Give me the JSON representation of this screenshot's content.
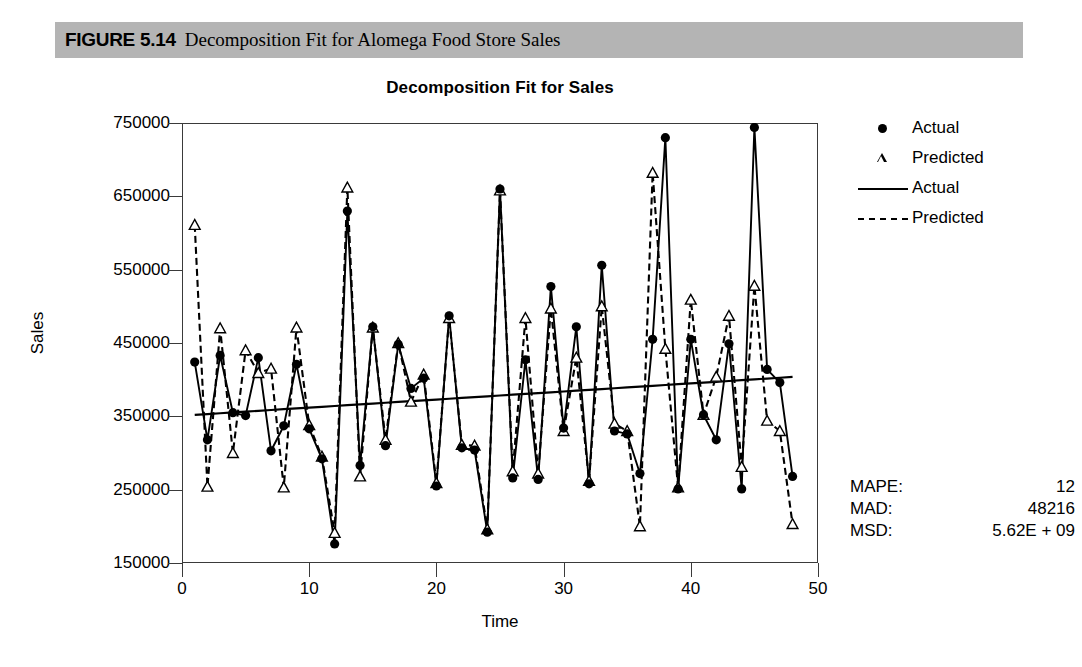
{
  "figure": {
    "number": "FIGURE 5.14",
    "caption": "Decomposition Fit for Alomega Food Store Sales"
  },
  "chart_data": {
    "type": "line",
    "title": "Decomposition Fit for Sales",
    "xlabel": "Time",
    "ylabel": "Sales",
    "xlim": [
      0,
      50
    ],
    "ylim": [
      150000,
      750000
    ],
    "xticks": [
      0,
      10,
      20,
      30,
      40,
      50
    ],
    "yticks": [
      150000,
      250000,
      350000,
      450000,
      550000,
      650000,
      750000
    ],
    "grid": false,
    "legend_position": "right",
    "legend": [
      {
        "label": "Actual",
        "marker": "filled-circle",
        "style": "marker"
      },
      {
        "label": "Predicted",
        "marker": "open-triangle",
        "style": "marker"
      },
      {
        "label": "Actual",
        "marker": "none",
        "style": "solid-line"
      },
      {
        "label": "Predicted",
        "marker": "none",
        "style": "dashed-line"
      }
    ],
    "x": [
      1,
      2,
      3,
      4,
      5,
      6,
      7,
      8,
      9,
      10,
      11,
      12,
      13,
      14,
      15,
      16,
      17,
      18,
      19,
      20,
      21,
      22,
      23,
      24,
      25,
      26,
      27,
      28,
      29,
      30,
      31,
      32,
      33,
      34,
      35,
      36,
      37,
      38,
      39,
      40,
      41,
      42,
      43,
      44,
      45,
      46,
      47,
      48
    ],
    "series": [
      {
        "name": "Actual",
        "marker": "filled-circle",
        "line": "solid",
        "values": [
          424000,
          318000,
          433000,
          355000,
          351000,
          430000,
          303000,
          337000,
          421000,
          333000,
          292000,
          176000,
          630000,
          283000,
          472000,
          310000,
          448000,
          388000,
          402000,
          255000,
          487000,
          307000,
          304000,
          192000,
          660000,
          266000,
          427000,
          264000,
          527000,
          334000,
          472000,
          258000,
          556000,
          330000,
          326000,
          272000,
          455000,
          730000,
          251000,
          455000,
          352000,
          318000,
          449000,
          251000,
          744000,
          414000,
          396000,
          268000
        ]
      },
      {
        "name": "Predicted",
        "marker": "open-triangle",
        "line": "dashed",
        "values": [
          611000,
          254000,
          470000,
          300000,
          440000,
          409000,
          415000,
          253000,
          471000,
          338000,
          295000,
          191000,
          662000,
          268000,
          471000,
          318000,
          450000,
          370000,
          407000,
          259000,
          484000,
          311000,
          310000,
          196000,
          658000,
          275000,
          484000,
          272000,
          497000,
          330000,
          430000,
          262000,
          500000,
          340000,
          330000,
          200000,
          682000,
          442000,
          253000,
          509000,
          352000,
          404000,
          487000,
          281000,
          528000,
          344000,
          330000,
          203000
        ]
      },
      {
        "name": "Trend",
        "marker": "none",
        "line": "solid",
        "values": [
          352000,
          353100,
          354200,
          355300,
          356400,
          357500,
          358600,
          359700,
          360800,
          361900,
          363000,
          364100,
          365200,
          366300,
          367400,
          368500,
          369600,
          370700,
          371800,
          372900,
          374000,
          375100,
          376200,
          377300,
          378400,
          379500,
          380600,
          381700,
          382800,
          383900,
          385000,
          386100,
          387200,
          388300,
          389400,
          390500,
          391600,
          392700,
          393800,
          394900,
          396000,
          397100,
          398200,
          399300,
          400400,
          401500,
          402600,
          403700
        ]
      }
    ]
  },
  "stats": [
    {
      "label": "MAPE:",
      "value": "12"
    },
    {
      "label": "MAD:",
      "value": "48216"
    },
    {
      "label": "MSD:",
      "value": "5.62E + 09"
    }
  ]
}
